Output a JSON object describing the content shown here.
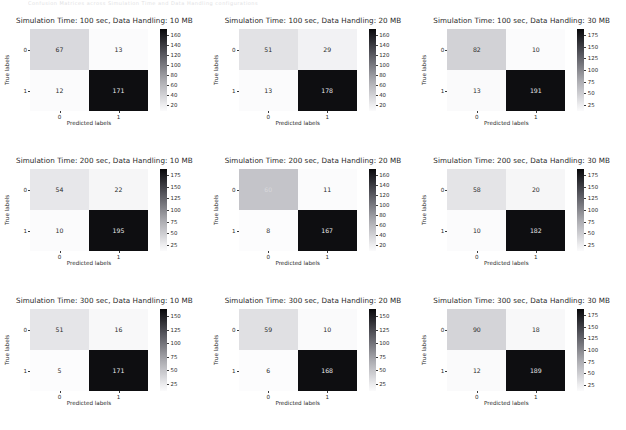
{
  "figure": {
    "top_partial_text": "Confusion Matrices across Simulation Time and Data Handling configurations",
    "axis_labels": {
      "x": "Predicted labels",
      "y": "True labels"
    },
    "class_ticks": [
      "0",
      "1"
    ],
    "colors": {
      "cmap_low": "#ffffff",
      "cmap_high": "#08080a",
      "text_dark": "#2a2a2a",
      "text_on_dark": "#e8e8ea",
      "background": "#ffffff"
    }
  },
  "chart_data": [
    {
      "type": "heatmap",
      "title": "Simulation Time: 100 sec, Data Handling: 10 MB",
      "xlabel": "Predicted labels",
      "ylabel": "True labels",
      "categories": [
        "0",
        "1"
      ],
      "matrix": [
        [
          67,
          13
        ],
        [
          12,
          171
        ]
      ],
      "cells": {
        "tl": "67",
        "tr": "13",
        "bl": "12",
        "br": "171"
      },
      "cell_shades": {
        "tl": "#d9d9dd",
        "tr": "#fbfbfc",
        "bl": "#fbfbfc",
        "br": "#0e0e11"
      },
      "cell_text_colors": {
        "tl": "#2a2a2a",
        "tr": "#2a2a2a",
        "bl": "#2a2a2a",
        "br": "#e8e8ea"
      },
      "colorbar_ticks": [
        "160",
        "140",
        "120",
        "100",
        "80",
        "60",
        "40",
        "20"
      ],
      "colorbar_range": [
        12,
        171
      ],
      "vmax": 171
    },
    {
      "type": "heatmap",
      "title": "Simulation Time: 100 sec, Data Handling: 20 MB",
      "xlabel": "Predicted labels",
      "ylabel": "True labels",
      "categories": [
        "0",
        "1"
      ],
      "matrix": [
        [
          51,
          29
        ],
        [
          13,
          178
        ]
      ],
      "cells": {
        "tl": "51",
        "tr": "29",
        "bl": "13",
        "br": "178"
      },
      "cell_shades": {
        "tl": "#e2e2e5",
        "tr": "#f2f2f4",
        "bl": "#fbfbfc",
        "br": "#0e0e11"
      },
      "cell_text_colors": {
        "tl": "#2a2a2a",
        "tr": "#2a2a2a",
        "bl": "#2a2a2a",
        "br": "#e8e8ea"
      },
      "colorbar_ticks": [
        "160",
        "140",
        "120",
        "100",
        "80",
        "60",
        "40",
        "20"
      ],
      "colorbar_range": [
        13,
        178
      ],
      "vmax": 178
    },
    {
      "type": "heatmap",
      "title": "Simulation Time: 100 sec, Data Handling: 30 MB",
      "xlabel": "Predicted labels",
      "ylabel": "True labels",
      "categories": [
        "0",
        "1"
      ],
      "matrix": [
        [
          82,
          10
        ],
        [
          13,
          191
        ]
      ],
      "cells": {
        "tl": "82",
        "tr": "10",
        "bl": "13",
        "br": "191"
      },
      "cell_shades": {
        "tl": "#d2d2d6",
        "tr": "#fbfbfc",
        "bl": "#fafafb",
        "br": "#0e0e11"
      },
      "cell_text_colors": {
        "tl": "#2a2a2a",
        "tr": "#2a2a2a",
        "bl": "#2a2a2a",
        "br": "#e8e8ea"
      },
      "colorbar_ticks": [
        "175",
        "150",
        "125",
        "100",
        "75",
        "50",
        "25"
      ],
      "colorbar_range": [
        10,
        191
      ],
      "vmax": 191
    },
    {
      "type": "heatmap",
      "title": "Simulation Time: 200 sec, Data Handling: 10 MB",
      "xlabel": "Predicted labels",
      "ylabel": "True labels",
      "categories": [
        "0",
        "1"
      ],
      "matrix": [
        [
          54,
          22
        ],
        [
          10,
          195
        ]
      ],
      "cells": {
        "tl": "54",
        "tr": "22",
        "bl": "10",
        "br": "195"
      },
      "cell_shades": {
        "tl": "#e7e7ea",
        "tr": "#f6f6f7",
        "bl": "#fbfbfc",
        "br": "#0e0e11"
      },
      "cell_text_colors": {
        "tl": "#2a2a2a",
        "tr": "#2a2a2a",
        "bl": "#2a2a2a",
        "br": "#e8e8ea"
      },
      "colorbar_ticks": [
        "175",
        "150",
        "125",
        "100",
        "75",
        "50",
        "25"
      ],
      "colorbar_range": [
        10,
        195
      ],
      "vmax": 195
    },
    {
      "type": "heatmap",
      "title": "Simulation Time: 200 sec, Data Handling: 20 MB",
      "xlabel": "Predicted labels",
      "ylabel": "True labels",
      "categories": [
        "0",
        "1"
      ],
      "matrix": [
        [
          60,
          11
        ],
        [
          8,
          167
        ]
      ],
      "cells": {
        "tl": "60",
        "tr": "11",
        "bl": "8",
        "br": "167"
      },
      "cell_shades": {
        "tl": "#c4c4c9",
        "tr": "#fbfbfc",
        "bl": "#fcfcfd",
        "br": "#0e0e11"
      },
      "cell_text_colors": {
        "tl": "#d8d8dc",
        "tr": "#2a2a2a",
        "bl": "#2a2a2a",
        "br": "#e8e8ea"
      },
      "colorbar_ticks": [
        "160",
        "140",
        "120",
        "100",
        "80",
        "60",
        "40",
        "20"
      ],
      "colorbar_range": [
        8,
        167
      ],
      "vmax": 167
    },
    {
      "type": "heatmap",
      "title": "Simulation Time: 200 sec, Data Handling: 30 MB",
      "xlabel": "Predicted labels",
      "ylabel": "True labels",
      "categories": [
        "0",
        "1"
      ],
      "matrix": [
        [
          58,
          20
        ],
        [
          10,
          182
        ]
      ],
      "cells": {
        "tl": "58",
        "tr": "20",
        "bl": "10",
        "br": "182"
      },
      "cell_shades": {
        "tl": "#e4e4e7",
        "tr": "#f6f6f7",
        "bl": "#fbfbfc",
        "br": "#0e0e11"
      },
      "cell_text_colors": {
        "tl": "#2a2a2a",
        "tr": "#2a2a2a",
        "bl": "#2a2a2a",
        "br": "#e8e8ea"
      },
      "colorbar_ticks": [
        "175",
        "150",
        "125",
        "100",
        "75",
        "50",
        "25"
      ],
      "colorbar_range": [
        10,
        182
      ],
      "vmax": 182
    },
    {
      "type": "heatmap",
      "title": "Simulation Time: 300 sec, Data Handling: 10 MB",
      "xlabel": "Predicted labels",
      "ylabel": "True labels",
      "categories": [
        "0",
        "1"
      ],
      "matrix": [
        [
          51,
          16
        ],
        [
          5,
          171
        ]
      ],
      "cells": {
        "tl": "51",
        "tr": "16",
        "bl": "5",
        "br": "171"
      },
      "cell_shades": {
        "tl": "#e5e5e8",
        "tr": "#f8f8f9",
        "bl": "#fcfcfd",
        "br": "#0e0e11"
      },
      "cell_text_colors": {
        "tl": "#2a2a2a",
        "tr": "#2a2a2a",
        "bl": "#2a2a2a",
        "br": "#e8e8ea"
      },
      "colorbar_ticks": [
        "150",
        "125",
        "100",
        "75",
        "50",
        "25"
      ],
      "colorbar_range": [
        5,
        171
      ],
      "vmax": 171
    },
    {
      "type": "heatmap",
      "title": "Simulation Time: 300 sec, Data Handling: 20 MB",
      "xlabel": "Predicted labels",
      "ylabel": "True labels",
      "categories": [
        "0",
        "1"
      ],
      "matrix": [
        [
          59,
          10
        ],
        [
          6,
          168
        ]
      ],
      "cells": {
        "tl": "59",
        "tr": "10",
        "bl": "6",
        "br": "168"
      },
      "cell_shades": {
        "tl": "#e0e0e3",
        "tr": "#fafafb",
        "bl": "#fcfcfd",
        "br": "#0e0e11"
      },
      "cell_text_colors": {
        "tl": "#2a2a2a",
        "tr": "#2a2a2a",
        "bl": "#2a2a2a",
        "br": "#e8e8ea"
      },
      "colorbar_ticks": [
        "150",
        "125",
        "100",
        "75",
        "50",
        "25"
      ],
      "colorbar_range": [
        6,
        168
      ],
      "vmax": 168
    },
    {
      "type": "heatmap",
      "title": "Simulation Time: 300 sec, Data Handling: 30 MB",
      "xlabel": "Predicted labels",
      "ylabel": "True labels",
      "categories": [
        "0",
        "1"
      ],
      "matrix": [
        [
          90,
          18
        ],
        [
          12,
          189
        ]
      ],
      "cells": {
        "tl": "90",
        "tr": "18",
        "bl": "12",
        "br": "189"
      },
      "cell_shades": {
        "tl": "#d4d4d8",
        "tr": "#f8f8f9",
        "bl": "#fafafb",
        "br": "#0e0e11"
      },
      "cell_text_colors": {
        "tl": "#2a2a2a",
        "tr": "#2a2a2a",
        "bl": "#2a2a2a",
        "br": "#e8e8ea"
      },
      "colorbar_ticks": [
        "175",
        "150",
        "125",
        "100",
        "75",
        "50",
        "25"
      ],
      "colorbar_range": [
        12,
        189
      ],
      "vmax": 189
    }
  ]
}
